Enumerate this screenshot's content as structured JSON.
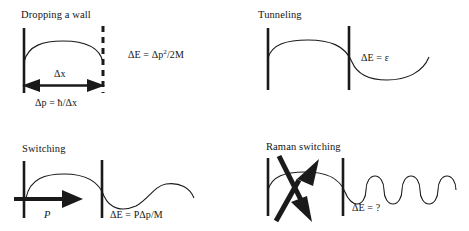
{
  "figure": {
    "stroke_color": "#1a1a1a",
    "background_color": "#ffffff"
  },
  "panels": [
    {
      "id": "dropping-a-wall",
      "title": "Dropping a wall",
      "energy_formula": "ΔE = Δp",
      "energy_formula_sup": "2",
      "energy_formula_tail": "/2M",
      "width_label": "Δx",
      "momentum_formula": "Δp = ħ/Δx",
      "left_wall": "solid",
      "right_wall": "dashed",
      "arrow": "double-headed-horizontal"
    },
    {
      "id": "tunneling",
      "title": "Tunneling",
      "energy_formula": "ΔE = ε",
      "left_wall": "solid",
      "right_wall": "solid",
      "arrow": "none"
    },
    {
      "id": "switching",
      "title": "Switching",
      "energy_formula": "ΔE = PΔp/M",
      "momentum_label": "P",
      "left_wall": "solid",
      "right_wall": "solid",
      "arrow": "single-headed-right"
    },
    {
      "id": "raman-switching",
      "title": "Raman switching",
      "energy_formula": "ΔE = ?",
      "left_wall": "solid",
      "right_wall": "solid",
      "arrow": "crossed-double-arrows",
      "wave_cycles": 4
    }
  ]
}
